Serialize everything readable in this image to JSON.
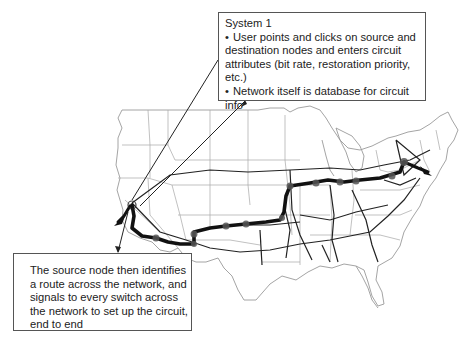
{
  "diagram": {
    "top_callout": {
      "heading": "System 1",
      "bullets": [
        "User points and clicks on source and destination nodes and enters circuit attributes (bit rate, restoration priority, etc.)",
        "Network itself is database for circuit info"
      ]
    },
    "bottom_callout": {
      "text": "The source node then identifies a route across the network, and signals to every switch across the network to set up the circuit, end to end"
    },
    "map": {
      "region": "Continental United States",
      "source_node": "West coast (San Francisco Bay area)",
      "destination_node": "East coast (New York area)",
      "colors": {
        "state_borders": "#9a9a9a",
        "network_links": "#222222",
        "circuit_route": "#111111",
        "switch_nodes": "#555555"
      }
    },
    "bullet_glyph": "•"
  }
}
